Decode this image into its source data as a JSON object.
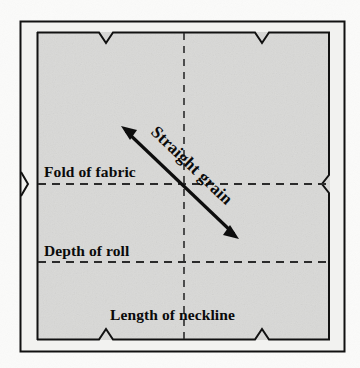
{
  "figure": {
    "background_color": "#ffffff",
    "fabric_fill": "#d9d9d7",
    "line_color": "#0d0d0d",
    "dash_color": "#2b2b2b",
    "outer_frame": {
      "x": 20,
      "y": 21,
      "width": 325,
      "height": 331
    },
    "inner_frame": {
      "x": 37,
      "y": 32,
      "width": 293,
      "height": 308
    },
    "labels": {
      "fold_of_fabric": "Fold of fabric",
      "depth_of_roll": "Depth of roll",
      "length_of_neckline": "Length of neckline",
      "straight_grain": "Straight grain"
    },
    "guide_lines": {
      "center_vertical_x": 184,
      "fold_of_fabric_y": 184,
      "depth_of_roll_y": 262
    },
    "grain_arrow": {
      "start_x": 122,
      "start_y": 127,
      "end_x": 238,
      "end_y": 238,
      "double_headed": "true",
      "angle_degrees": 43.7
    },
    "notches": {
      "top": [
        106,
        262
      ],
      "bottom": [
        106,
        262
      ],
      "left_y": 184,
      "right_y": 184
    }
  }
}
